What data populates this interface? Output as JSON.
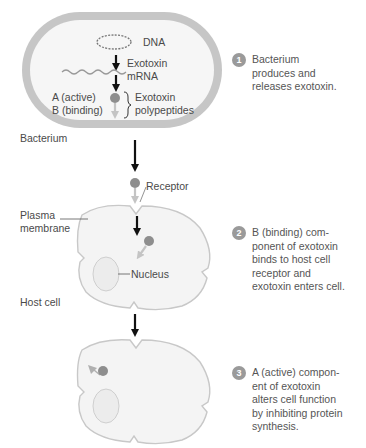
{
  "colors": {
    "bacterium_wall": "#c6c6c6",
    "cell_fill": "#f4f4f4",
    "cell_outline": "#c8c8c8",
    "toxin_a": "#8e8e8e",
    "toxin_b_arrow": "#c8c8c8",
    "nucleus": "#ececec",
    "badge": "#9a9a9a"
  },
  "bacterium": {
    "dna_label": "DNA",
    "mrna_label": "Exotoxin\nmRNA",
    "a_label": "A (active)",
    "b_label": "B (binding)",
    "polypeptides_label": "Exotoxin\npolypeptides",
    "name_label": "Bacterium"
  },
  "host": {
    "receptor_label": "Receptor",
    "plasma_membrane_label": "Plasma\nmembrane",
    "nucleus_label": "Nucleus",
    "name_label": "Host cell"
  },
  "steps": [
    {
      "number": "1",
      "text": "Bacterium\nproduces and\nreleases exotoxin."
    },
    {
      "number": "2",
      "text": "B (binding) com-\nponent of exotoxin\nbinds to host cell\nreceptor and\nexotoxin enters cell."
    },
    {
      "number": "3",
      "text": "A (active) compon-\nent of exotoxin\nalters cell function\nby inhibiting protein\nsynthesis."
    }
  ]
}
